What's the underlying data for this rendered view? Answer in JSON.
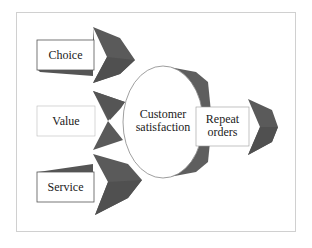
{
  "diagram": {
    "inputs": [
      {
        "label": "Choice"
      },
      {
        "label": "Value"
      },
      {
        "label": "Service"
      }
    ],
    "center": {
      "line1": "Customer",
      "line2": "satisfaction"
    },
    "output": {
      "line1": "Repeat",
      "line2": "orders"
    }
  },
  "colors": {
    "arrow_head": "#5a5a5a",
    "arrow_head_light": "#6e6e6e",
    "box_fill": "#ffffff",
    "stroke": "#555555",
    "frame": "#d0d0d0"
  }
}
